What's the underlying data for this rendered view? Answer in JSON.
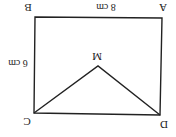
{
  "diagram": {
    "rotation_deg": 180,
    "colors": {
      "line": "#222222",
      "background": "#ffffff",
      "text": "#222222"
    },
    "vertices": {
      "A": {
        "label": "A",
        "x": 162,
        "y": 18,
        "label_x": 163,
        "label_y": 8
      },
      "B": {
        "label": "B",
        "x": 35,
        "y": 17,
        "label_x": 28,
        "label_y": 8
      },
      "C": {
        "label": "C",
        "x": 34,
        "y": 113,
        "label_x": 27,
        "label_y": 121
      },
      "D": {
        "label": "D",
        "x": 160,
        "y": 115,
        "label_x": 164,
        "label_y": 123
      },
      "M": {
        "label": "M",
        "x": 98,
        "y": 66,
        "label_x": 97,
        "label_y": 56
      }
    },
    "dimensions": {
      "AB": {
        "text": "8 cm",
        "x": 106,
        "y": 8
      },
      "BC": {
        "text": "6 cm",
        "x": 20,
        "y": 64
      }
    }
  }
}
